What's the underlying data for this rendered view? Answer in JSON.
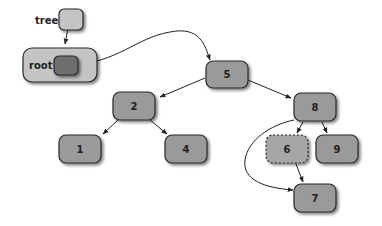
{
  "diagram": {
    "type": "binary-search-tree",
    "pointer": {
      "label": "tree"
    },
    "holder": {
      "label": "root"
    },
    "nodes": [
      {
        "id": "n5",
        "label": "5"
      },
      {
        "id": "n2",
        "label": "2"
      },
      {
        "id": "n8",
        "label": "8"
      },
      {
        "id": "n1",
        "label": "1"
      },
      {
        "id": "n4",
        "label": "4"
      },
      {
        "id": "n6",
        "label": "6",
        "style": "dashed"
      },
      {
        "id": "n9",
        "label": "9"
      },
      {
        "id": "n7",
        "label": "7"
      }
    ],
    "edges": [
      {
        "from": "tree",
        "to": "root"
      },
      {
        "from": "root",
        "to": "5"
      },
      {
        "from": "5",
        "to": "2"
      },
      {
        "from": "5",
        "to": "8"
      },
      {
        "from": "2",
        "to": "1"
      },
      {
        "from": "2",
        "to": "4"
      },
      {
        "from": "8",
        "to": "6"
      },
      {
        "from": "8",
        "to": "9"
      },
      {
        "from": "8",
        "to": "7"
      },
      {
        "from": "6",
        "to": "7"
      }
    ],
    "colors": {
      "node_fill": "#9a9a9a",
      "node_stroke": "#2a2a2a",
      "root_box_fill": "#c4c4c4",
      "root_inner_fill": "#6e6e6e"
    }
  }
}
